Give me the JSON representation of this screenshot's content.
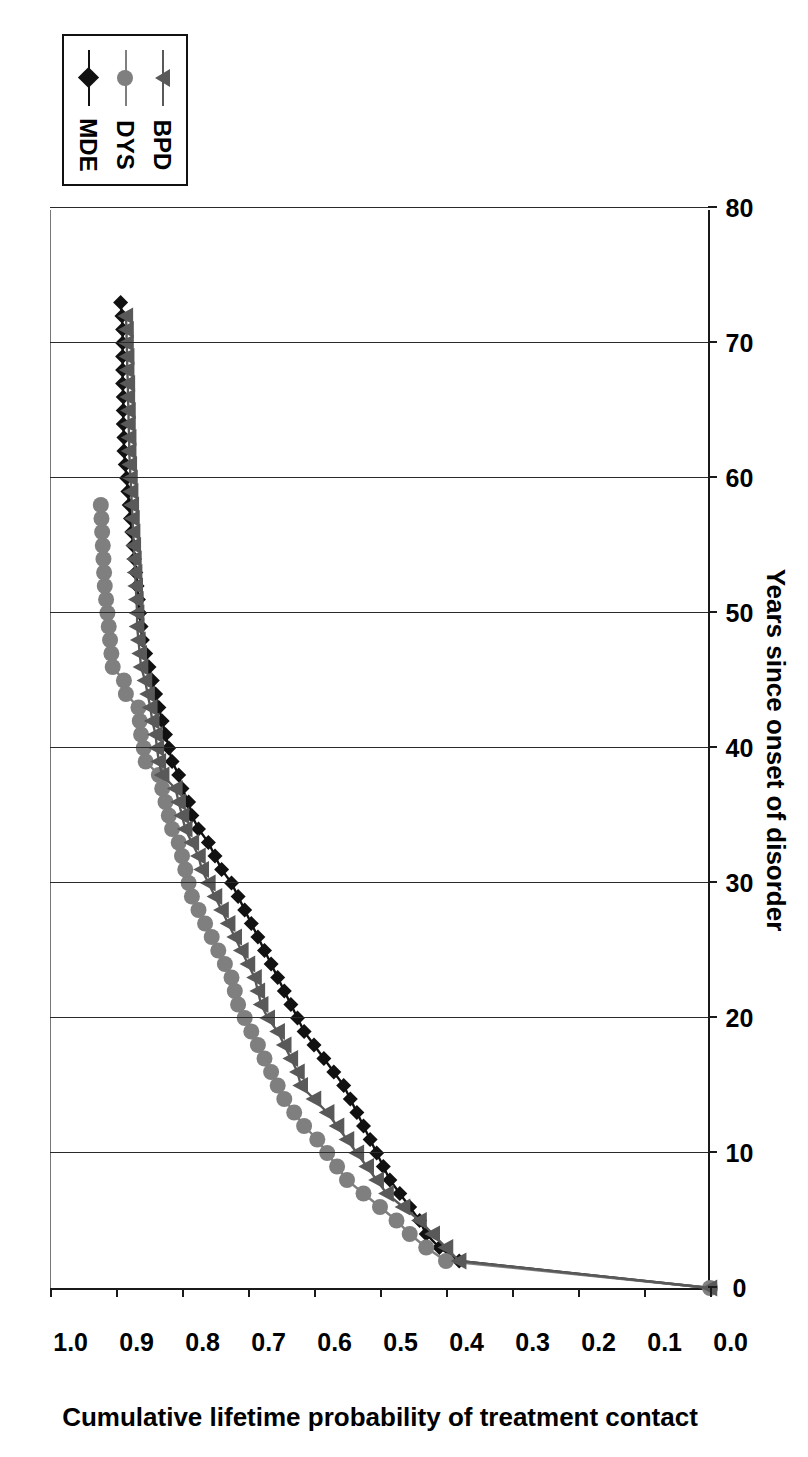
{
  "chart": {
    "title": "",
    "x_axis_title": "Years since onset of disorder",
    "y_axis_title": "Cumulative lifetime probability of treatment contact",
    "x_ticks": [
      "0",
      "10",
      "20",
      "30",
      "40",
      "50",
      "60",
      "70",
      "80"
    ],
    "y_ticks": [
      "0.0",
      "0.1",
      "0.2",
      "0.3",
      "0.4",
      "0.5",
      "0.6",
      "0.7",
      "0.8",
      "0.9",
      "1.0"
    ],
    "legend": [
      {
        "label": "MDE",
        "marker": "diamond",
        "color": "#111111"
      },
      {
        "label": "DYS",
        "marker": "circle",
        "color": "#7f7f7f"
      },
      {
        "label": "BPD",
        "marker": "triangle",
        "color": "#595959"
      }
    ]
  },
  "chart_data": {
    "type": "line",
    "title": "",
    "xlabel": "Years since onset of disorder",
    "ylabel": "Cumulative lifetime probability of treatment contact",
    "xlim": [
      0,
      80
    ],
    "ylim": [
      0.0,
      1.0
    ],
    "xticks": [
      0,
      10,
      20,
      30,
      40,
      50,
      60,
      70,
      80
    ],
    "yticks": [
      0.0,
      0.1,
      0.2,
      0.3,
      0.4,
      0.5,
      0.6,
      0.7,
      0.8,
      0.9,
      1.0
    ],
    "grid": "vertical-major-only",
    "legend_position": "top-right",
    "series": [
      {
        "name": "MDE",
        "marker": "diamond",
        "color": "#111111",
        "x": [
          0,
          2,
          3,
          4,
          5,
          6,
          7,
          8,
          9,
          10,
          11,
          12,
          13,
          14,
          15,
          16,
          17,
          18,
          19,
          20,
          21,
          22,
          23,
          24,
          25,
          26,
          27,
          28,
          29,
          30,
          31,
          32,
          33,
          34,
          35,
          36,
          37,
          38,
          39,
          40,
          41,
          42,
          43,
          44,
          45,
          46,
          47,
          48,
          49,
          50,
          51,
          52,
          53,
          54,
          55,
          56,
          57,
          58,
          59,
          60,
          61,
          62,
          63,
          64,
          65,
          66,
          67,
          68,
          69,
          70,
          71,
          72,
          73
        ],
        "y": [
          0.0,
          0.38,
          0.41,
          0.43,
          0.44,
          0.455,
          0.47,
          0.485,
          0.495,
          0.505,
          0.515,
          0.525,
          0.535,
          0.545,
          0.555,
          0.57,
          0.585,
          0.6,
          0.615,
          0.625,
          0.635,
          0.645,
          0.655,
          0.665,
          0.675,
          0.685,
          0.695,
          0.705,
          0.715,
          0.725,
          0.74,
          0.75,
          0.76,
          0.775,
          0.785,
          0.79,
          0.8,
          0.805,
          0.815,
          0.82,
          0.825,
          0.83,
          0.835,
          0.84,
          0.845,
          0.85,
          0.855,
          0.86,
          0.862,
          0.864,
          0.866,
          0.868,
          0.87,
          0.872,
          0.874,
          0.876,
          0.878,
          0.88,
          0.882,
          0.884,
          0.886,
          0.888,
          0.888,
          0.889,
          0.889,
          0.889,
          0.89,
          0.89,
          0.89,
          0.89,
          0.89,
          0.891,
          0.893
        ]
      },
      {
        "name": "DYS",
        "marker": "circle",
        "color": "#7f7f7f",
        "x": [
          0,
          2,
          3,
          4,
          5,
          6,
          7,
          8,
          9,
          10,
          11,
          12,
          13,
          14,
          15,
          16,
          17,
          18,
          19,
          20,
          21,
          22,
          23,
          24,
          25,
          26,
          27,
          28,
          29,
          30,
          31,
          32,
          33,
          34,
          35,
          36,
          37,
          38,
          39,
          40,
          41,
          42,
          43,
          44,
          45,
          46,
          47,
          48,
          49,
          50,
          51,
          52,
          53,
          54,
          55,
          56,
          57,
          58
        ],
        "y": [
          0.0,
          0.4,
          0.43,
          0.455,
          0.475,
          0.5,
          0.525,
          0.55,
          0.565,
          0.58,
          0.595,
          0.615,
          0.63,
          0.645,
          0.655,
          0.665,
          0.675,
          0.685,
          0.695,
          0.705,
          0.715,
          0.72,
          0.725,
          0.735,
          0.745,
          0.755,
          0.765,
          0.775,
          0.785,
          0.79,
          0.795,
          0.8,
          0.805,
          0.815,
          0.82,
          0.825,
          0.83,
          0.835,
          0.855,
          0.858,
          0.862,
          0.864,
          0.866,
          0.885,
          0.888,
          0.905,
          0.907,
          0.909,
          0.911,
          0.913,
          0.915,
          0.917,
          0.918,
          0.919,
          0.92,
          0.921,
          0.922,
          0.923
        ]
      },
      {
        "name": "BPD",
        "marker": "triangle",
        "color": "#595959",
        "x": [
          0,
          2,
          3,
          4,
          5,
          6,
          7,
          8,
          9,
          10,
          11,
          12,
          13,
          14,
          15,
          16,
          17,
          18,
          19,
          20,
          21,
          22,
          23,
          24,
          25,
          26,
          27,
          28,
          29,
          30,
          31,
          32,
          33,
          34,
          35,
          36,
          37,
          38,
          39,
          40,
          41,
          42,
          43,
          44,
          45,
          46,
          47,
          48,
          49,
          50,
          51,
          52,
          53,
          54,
          55,
          56,
          57,
          58,
          59,
          60,
          61,
          62,
          63,
          64,
          65,
          66,
          67,
          68,
          69,
          70,
          71,
          72
        ],
        "y": [
          0.0,
          0.38,
          0.4,
          0.42,
          0.44,
          0.465,
          0.49,
          0.505,
          0.52,
          0.535,
          0.55,
          0.565,
          0.58,
          0.6,
          0.62,
          0.625,
          0.635,
          0.645,
          0.655,
          0.67,
          0.68,
          0.685,
          0.69,
          0.7,
          0.71,
          0.72,
          0.73,
          0.74,
          0.75,
          0.76,
          0.77,
          0.775,
          0.785,
          0.795,
          0.8,
          0.805,
          0.81,
          0.83,
          0.835,
          0.838,
          0.84,
          0.845,
          0.848,
          0.852,
          0.856,
          0.862,
          0.864,
          0.866,
          0.868,
          0.868,
          0.869,
          0.87,
          0.871,
          0.872,
          0.873,
          0.874,
          0.875,
          0.876,
          0.877,
          0.878,
          0.879,
          0.88,
          0.88,
          0.881,
          0.881,
          0.882,
          0.882,
          0.883,
          0.883,
          0.884,
          0.884,
          0.885
        ]
      }
    ]
  }
}
